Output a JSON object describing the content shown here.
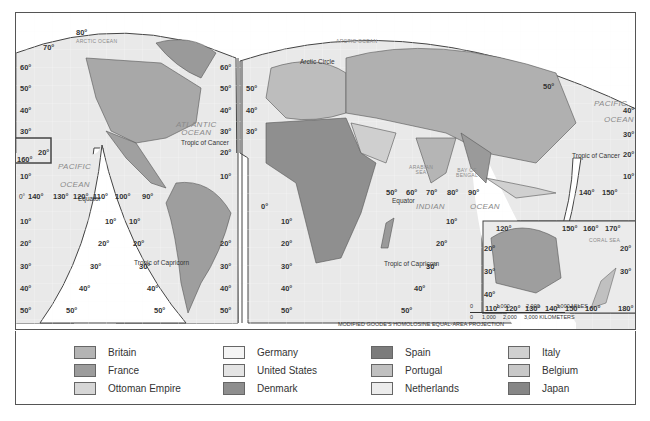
{
  "map": {
    "projection_note": "MODIFIED GOODE'S HOMOLOSINE EQUAL-AREA PROJECTION",
    "oceans": [
      {
        "id": "arctic-nw",
        "label": "ARCTIC OCEAN"
      },
      {
        "id": "arctic-ne",
        "label": "ARCTIC OCEAN"
      },
      {
        "id": "atlantic",
        "label": "ATLANTIC\nOCEAN"
      },
      {
        "id": "pacific-w",
        "label": "PACIFIC"
      },
      {
        "id": "pacific-w2",
        "label": "OCEAN"
      },
      {
        "id": "pacific-e",
        "label": "PACIFIC"
      },
      {
        "id": "pacific-e2",
        "label": "OCEAN"
      },
      {
        "id": "indian",
        "label": "INDIAN"
      },
      {
        "id": "indian2",
        "label": "OCEAN"
      },
      {
        "id": "arabian",
        "label": "ARABIAN\nSEA"
      },
      {
        "id": "bengal",
        "label": "BAY OF\nBENGAL"
      },
      {
        "id": "coral",
        "label": "CORAL SEA"
      }
    ],
    "notes": {
      "arctic_circle": "Arctic Circle",
      "tropic_cancer_w": "Tropic of Cancer",
      "tropic_cancer_e": "Tropic of Cancer",
      "tropic_capricorn_w": "Tropic of Capricorn",
      "tropic_capricorn_e": "Tropic of Capricorn",
      "equator_w": "Equator",
      "equator_e": "Equator"
    },
    "lat_labels_left": [
      "60°",
      "50°",
      "40°",
      "30°",
      "20°",
      "10°",
      "0°",
      "10°",
      "20°",
      "30°",
      "40°",
      "50°"
    ],
    "lat_labels_americas_right": [
      "60°",
      "50°",
      "40°",
      "30°",
      "20°",
      "10°"
    ],
    "lat_labels_sa_right": [
      "20°",
      "30°",
      "40°",
      "50°"
    ],
    "lat_labels_eurasia_left": [
      "50°",
      "40°",
      "30°"
    ],
    "lat_labels_africa_left": [
      "10°",
      "20°",
      "30°",
      "40°",
      "50°"
    ],
    "lat_labels_pacific_right": [
      "50°",
      "40°",
      "30°",
      "20°",
      "10°"
    ],
    "lon_labels_pacific": [
      "140°",
      "130°",
      "120°",
      "110°",
      "100°",
      "90°"
    ],
    "lon_labels_indian": [
      "50°",
      "60°",
      "70°",
      "80°",
      "90°"
    ],
    "lon_labels_asia": [
      "140°",
      "150°"
    ],
    "misc_labels": {
      "lat80": "80°",
      "lat70": "70°",
      "hawaii_lon": "160°",
      "hawaii_lat": "20°",
      "africa_0": "0°"
    },
    "lobe_lat_labels": {
      "pac_left": [
        "10°",
        "20°",
        "30°",
        "40°",
        "50°"
      ],
      "pac_right": [
        "10°",
        "20°",
        "30°",
        "40°",
        "50°"
      ],
      "ind_right": [
        "10°",
        "20°",
        "30°",
        "40°",
        "50°"
      ]
    },
    "australia_inset": {
      "top_lon": [
        "120°",
        "150°",
        "160°",
        "170°"
      ],
      "bottom_lon": [
        "110°",
        "120°",
        "130°",
        "140°",
        "150°",
        "160°",
        "180°"
      ],
      "lat_left": [
        "20°",
        "30°",
        "40°"
      ],
      "lat_right": [
        "20°",
        "30°"
      ]
    },
    "scale": {
      "miles_ticks": [
        "0",
        "1,000",
        "2,000",
        "3,000 MILES"
      ],
      "km_ticks": [
        "0",
        "1,000",
        "2,000",
        "3,000 KILOMETERS"
      ]
    }
  },
  "legend": {
    "items": [
      {
        "label": "Britain",
        "color": "#b4b4b4"
      },
      {
        "label": "France",
        "color": "#9c9c9c"
      },
      {
        "label": "Ottoman Empire",
        "color": "#d6d6d6"
      },
      {
        "label": "Germany",
        "color": "#f4f4f4"
      },
      {
        "label": "United States",
        "color": "#e4e4e4"
      },
      {
        "label": "Denmark",
        "color": "#8e8e8e"
      },
      {
        "label": "Spain",
        "color": "#7c7c7c"
      },
      {
        "label": "Portugal",
        "color": "#c0c0c0"
      },
      {
        "label": "Netherlands",
        "color": "#ececec"
      },
      {
        "label": "Italy",
        "color": "#d0d0d0"
      },
      {
        "label": "Belgium",
        "color": "#c8c8c8"
      },
      {
        "label": "Japan",
        "color": "#868686"
      }
    ]
  }
}
